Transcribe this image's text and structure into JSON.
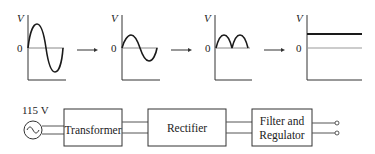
{
  "graphs": [
    {
      "id": "ac-input",
      "y_label": "V",
      "zero_label": "0",
      "waveform": "full sine wave"
    },
    {
      "id": "ac-stepped-down",
      "y_label": "V",
      "zero_label": "0",
      "waveform": "smaller sine wave"
    },
    {
      "id": "rectified",
      "y_label": "V",
      "zero_label": "0",
      "waveform": "full-wave rectified"
    },
    {
      "id": "dc-output",
      "y_label": "V",
      "zero_label": "0",
      "waveform": "constant DC"
    }
  ],
  "block_diagram": {
    "source_label": "115 V",
    "blocks": [
      {
        "label": "Transformer"
      },
      {
        "label": "Rectifier"
      },
      {
        "label_line1": "Filter and",
        "label_line2": "Regulator"
      }
    ]
  },
  "colors": {
    "line": "#1a1a1a",
    "axis": "#333333",
    "zero_line": "#999999"
  }
}
